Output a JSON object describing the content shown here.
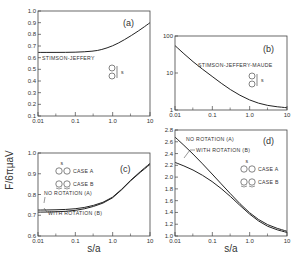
{
  "figure": {
    "ylabel": "F/6πμaV",
    "xlabel": "s/a"
  },
  "chart_data": [
    {
      "panel": "(a)",
      "type": "line",
      "xscale": "log",
      "xlim": [
        0.01,
        10
      ],
      "ylim": [
        0.1,
        1.0
      ],
      "xticks": [
        "0.01",
        "0.1",
        "1.0",
        "10"
      ],
      "yticks": [
        "0.1",
        "0.2",
        "0.3",
        "0.4",
        "0.5",
        "0.6",
        "0.7",
        "0.8",
        "0.9",
        "1.0"
      ],
      "annotation": "STIMSON-JEFFERY",
      "inset_label": "s",
      "series": [
        {
          "name": "STIMSON-JEFFERY",
          "x": [
            0.01,
            0.03,
            0.1,
            0.3,
            0.5,
            1.0,
            2.0,
            5.0,
            10
          ],
          "y": [
            0.645,
            0.645,
            0.646,
            0.655,
            0.668,
            0.7,
            0.75,
            0.83,
            0.9
          ]
        }
      ]
    },
    {
      "panel": "(b)",
      "type": "line",
      "xscale": "log",
      "yscale": "log",
      "xlim": [
        0.01,
        10
      ],
      "ylim": [
        1,
        100
      ],
      "xticks": [
        "0.01",
        "0.1",
        "1.0",
        "10"
      ],
      "yticks": [
        "1",
        "10",
        "100"
      ],
      "annotation": "STIMSON-JEFFERY-MAUDE",
      "inset_label": "s",
      "series": [
        {
          "name": "STIMSON-JEFFERY-MAUDE",
          "x": [
            0.01,
            0.03,
            0.1,
            0.3,
            1.0,
            3.0,
            10
          ],
          "y": [
            55,
            20,
            8,
            3.5,
            1.8,
            1.3,
            1.15
          ]
        }
      ]
    },
    {
      "panel": "(c)",
      "type": "line",
      "xscale": "log",
      "xlim": [
        0.01,
        10
      ],
      "ylim": [
        0.6,
        1.0
      ],
      "xticks": [
        "0.01",
        "0.1",
        "1.0",
        "10"
      ],
      "yticks": [
        "0.6",
        "0.7",
        "0.8",
        "0.9",
        "1.0"
      ],
      "legend": [
        "CASE A",
        "CASE B"
      ],
      "annotations": [
        "NO ROTATION (A)",
        "WITH ROTATION (B)"
      ],
      "inset_label": "s",
      "series": [
        {
          "name": "NO ROTATION (A)",
          "x": [
            0.01,
            0.03,
            0.1,
            0.3,
            1.0,
            3.0,
            10
          ],
          "y": [
            0.725,
            0.726,
            0.73,
            0.745,
            0.78,
            0.87,
            0.95
          ]
        },
        {
          "name": "WITH ROTATION (B)",
          "x": [
            0.01,
            0.03,
            0.1,
            0.3,
            1.0,
            3.0,
            10
          ],
          "y": [
            0.715,
            0.716,
            0.722,
            0.74,
            0.777,
            0.868,
            0.945
          ]
        }
      ]
    },
    {
      "panel": "(d)",
      "type": "line",
      "xscale": "log",
      "xlim": [
        0.01,
        10
      ],
      "ylim": [
        1.0,
        2.8
      ],
      "xticks": [
        "0.01",
        "0.1",
        "1.0",
        "10"
      ],
      "yticks": [
        "1.0",
        "1.2",
        "1.4",
        "1.6",
        "1.8",
        "2.0",
        "2.2",
        "2.4",
        "2.6",
        "2.8"
      ],
      "legend": [
        "CASE A",
        "CASE B"
      ],
      "annotations": [
        "NO ROTATION (A)",
        "WITH ROTATION (B)"
      ],
      "inset_label": "s",
      "series": [
        {
          "name": "NO ROTATION (A)",
          "x": [
            0.01,
            0.03,
            0.1,
            0.3,
            1.0,
            3.0,
            10
          ],
          "y": [
            2.68,
            2.4,
            2.05,
            1.72,
            1.38,
            1.18,
            1.08
          ]
        },
        {
          "name": "WITH ROTATION (B)",
          "x": [
            0.01,
            0.03,
            0.1,
            0.3,
            1.0,
            3.0,
            10
          ],
          "y": [
            2.25,
            2.13,
            1.93,
            1.68,
            1.36,
            1.15,
            1.06
          ]
        }
      ]
    }
  ]
}
